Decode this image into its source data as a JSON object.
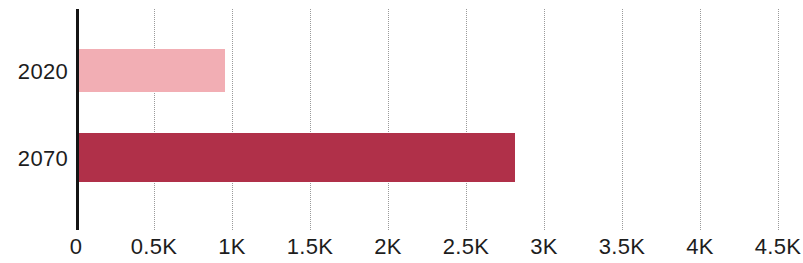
{
  "chart_data": {
    "type": "bar",
    "orientation": "horizontal",
    "title": "",
    "subtitle": "",
    "xlabel": "",
    "ylabel": "",
    "categories": [
      "2020",
      "2070"
    ],
    "values": [
      955,
      2815
    ],
    "series": [
      {
        "name": "",
        "values": [
          955,
          2815
        ],
        "colors": [
          "#f2aeb4",
          "#b03049"
        ]
      }
    ],
    "xlim": [
      0,
      4700
    ],
    "xticks": [
      0,
      500,
      1000,
      1500,
      2000,
      2500,
      3000,
      3500,
      4000,
      4500
    ],
    "xticklabels": [
      "0",
      "0.5K",
      "1K",
      "1.5K",
      "2K",
      "2.5K",
      "3K",
      "3.5K",
      "4K",
      "4.5K"
    ],
    "grid": "vertical-dotted",
    "legend": "none",
    "bars": [
      {
        "category": "2020",
        "value": 955,
        "color": "#f2aeb4"
      },
      {
        "category": "2070",
        "value": 2815,
        "color": "#b03049"
      }
    ]
  },
  "colors": {
    "bar_light": "#f2aeb4",
    "bar_dark": "#b03049",
    "axis": "#141414",
    "gridline": "#9a9a9a",
    "text": "#1d1d1d",
    "background": "#ffffff"
  },
  "axis": {
    "value_origin_px": 76,
    "px_per_500": 78
  }
}
